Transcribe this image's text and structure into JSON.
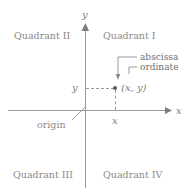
{
  "diagram": {
    "colors": {
      "axis": "#9a9a9a",
      "text": "#8a8a8a",
      "point": "#5a5a5a",
      "background": "#ffffff"
    },
    "quadrants": [
      {
        "id": "quadrant-1",
        "label": "Quadrant I"
      },
      {
        "id": "quadrant-2",
        "label": "Quadrant II"
      },
      {
        "id": "quadrant-3",
        "label": "Quadrant III"
      },
      {
        "id": "quadrant-4",
        "label": "Quadrant IV"
      }
    ],
    "axes": {
      "x_label": "x",
      "y_label": "y"
    },
    "origin_label": "origin",
    "point": {
      "label": "(x, y)",
      "x_tick_label": "x",
      "y_tick_label": "y"
    },
    "callouts": [
      {
        "id": "abscissa",
        "label": "abscissa"
      },
      {
        "id": "ordinate",
        "label": "ordinate"
      }
    ]
  }
}
